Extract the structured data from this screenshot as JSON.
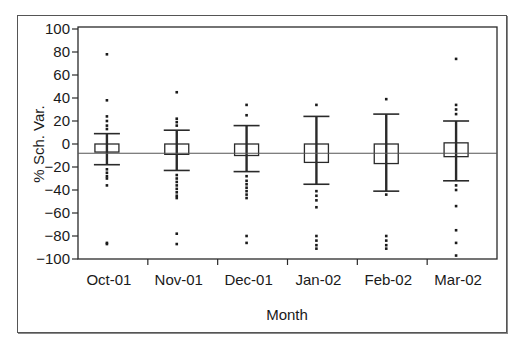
{
  "chart_data": {
    "type": "box",
    "title": "",
    "xlabel": "Month",
    "ylabel": "% Sch. Var.",
    "ylim": [
      -100,
      100
    ],
    "yticks": [
      100,
      80,
      60,
      40,
      20,
      0,
      -20,
      -40,
      -60,
      -80,
      -100
    ],
    "ytick_labels": [
      "100",
      "80",
      "60",
      "40",
      "20",
      "0",
      "−20",
      "−40",
      "−60",
      "−80",
      "−100"
    ],
    "categories": [
      "Oct-01",
      "Nov-01",
      "Dec-01",
      "Jan-02",
      "Feb-02",
      "Mar-02"
    ],
    "reference_line": -8,
    "grid": false,
    "legend": null,
    "boxes": [
      {
        "category": "Oct-01",
        "q1": -7,
        "q3": 0,
        "whisker_low": -18,
        "whisker_high": 9,
        "outliers": [
          78,
          38,
          24,
          20,
          16,
          13,
          -22,
          -25,
          -28,
          -30,
          -36,
          -86,
          -87
        ]
      },
      {
        "category": "Nov-01",
        "q1": -9,
        "q3": 0,
        "whisker_low": -23,
        "whisker_high": 12,
        "outliers": [
          45,
          22,
          19,
          16,
          -27,
          -30,
          -33,
          -36,
          -39,
          -42,
          -45,
          -47,
          -78,
          -87
        ]
      },
      {
        "category": "Dec-01",
        "q1": -10,
        "q3": 0,
        "whisker_low": -24,
        "whisker_high": 16,
        "outliers": [
          34,
          25,
          -28,
          -32,
          -35,
          -38,
          -41,
          -44,
          -47,
          -80,
          -86
        ]
      },
      {
        "category": "Jan-02",
        "q1": -16,
        "q3": 0,
        "whisker_low": -35,
        "whisker_high": 24,
        "outliers": [
          34,
          -41,
          -45,
          -49,
          -55,
          -80,
          -84,
          -88,
          -91
        ]
      },
      {
        "category": "Feb-02",
        "q1": -17,
        "q3": 0,
        "whisker_low": -41,
        "whisker_high": 26,
        "outliers": [
          39,
          -44,
          -80,
          -84,
          -88,
          -91
        ]
      },
      {
        "category": "Mar-02",
        "q1": -11,
        "q3": 1,
        "whisker_low": -32,
        "whisker_high": 20,
        "outliers": [
          74,
          34,
          30,
          26,
          -36,
          -40,
          -54,
          -75,
          -86,
          -97
        ]
      }
    ]
  },
  "y_axis": {
    "title": "% Sch. Var."
  },
  "x_axis": {
    "title": "Month"
  }
}
